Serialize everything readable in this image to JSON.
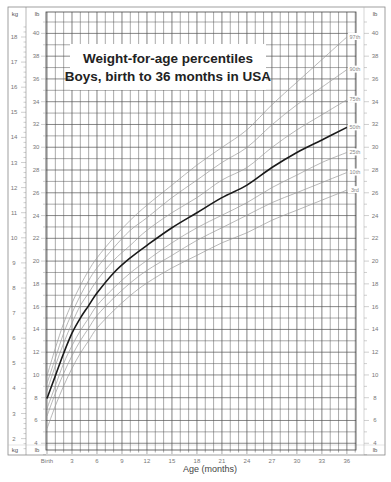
{
  "chart_data": {
    "type": "line",
    "title": "Weight-for-age percentiles",
    "subtitle": "Boys, birth to 36 months in USA",
    "xlabel": "Age (months)",
    "ylabel_left": "kg",
    "ylabel_right": "lb",
    "xlim": [
      0,
      36
    ],
    "ylim_kg": [
      1.5,
      18.5
    ],
    "x_ticks": [
      {
        "value": 0,
        "label": "Birth"
      },
      {
        "value": 3,
        "label": "3"
      },
      {
        "value": 6,
        "label": "6"
      },
      {
        "value": 9,
        "label": "9"
      },
      {
        "value": 12,
        "label": "12"
      },
      {
        "value": 15,
        "label": "15"
      },
      {
        "value": 18,
        "label": "18"
      },
      {
        "value": 21,
        "label": "21"
      },
      {
        "value": 24,
        "label": "24"
      },
      {
        "value": 27,
        "label": "27"
      },
      {
        "value": 30,
        "label": "30"
      },
      {
        "value": 33,
        "label": "33"
      },
      {
        "value": 36,
        "label": "36"
      }
    ],
    "kg_ticks": [
      2,
      3,
      4,
      5,
      6,
      7,
      8,
      9,
      10,
      11,
      12,
      13,
      14,
      15,
      16,
      17,
      18
    ],
    "lb_ticks": [
      4,
      6,
      8,
      10,
      12,
      14,
      16,
      18,
      20,
      22,
      24,
      26,
      28,
      30,
      32,
      34,
      36,
      38,
      40
    ],
    "grid": true,
    "x": [
      0,
      1,
      2,
      3,
      4,
      5,
      6,
      8,
      10,
      12,
      15,
      18,
      21,
      24,
      27,
      30,
      33,
      36
    ],
    "series": [
      {
        "name": "97th",
        "label": "97th",
        "emphasis": false,
        "values": [
          4.5,
          5.6,
          6.6,
          7.4,
          8.1,
          8.7,
          9.2,
          10.0,
          10.7,
          11.3,
          12.1,
          12.9,
          13.6,
          14.3,
          15.3,
          16.2,
          17.1,
          18.0
        ]
      },
      {
        "name": "90th",
        "label": "90th",
        "emphasis": false,
        "values": [
          4.2,
          5.2,
          6.2,
          7.0,
          7.7,
          8.3,
          8.8,
          9.6,
          10.3,
          10.8,
          11.6,
          12.3,
          13.0,
          13.6,
          14.5,
          15.3,
          16.0,
          16.7
        ]
      },
      {
        "name": "75th",
        "label": "75th",
        "emphasis": false,
        "values": [
          3.9,
          4.9,
          5.8,
          6.6,
          7.3,
          7.8,
          8.3,
          9.1,
          9.7,
          10.3,
          11.0,
          11.6,
          12.3,
          12.8,
          13.6,
          14.3,
          14.9,
          15.5
        ]
      },
      {
        "name": "50th",
        "label": "50th",
        "emphasis": true,
        "values": [
          3.6,
          4.5,
          5.4,
          6.2,
          6.8,
          7.3,
          7.8,
          8.6,
          9.2,
          9.7,
          10.4,
          11.0,
          11.6,
          12.1,
          12.8,
          13.4,
          13.9,
          14.4
        ]
      },
      {
        "name": "25th",
        "label": "25th",
        "emphasis": false,
        "values": [
          3.2,
          4.1,
          5.0,
          5.7,
          6.3,
          6.8,
          7.3,
          8.0,
          8.6,
          9.1,
          9.8,
          10.4,
          10.9,
          11.4,
          12.0,
          12.5,
          13.0,
          13.4
        ]
      },
      {
        "name": "10th",
        "label": "10th",
        "emphasis": false,
        "values": [
          2.9,
          3.8,
          4.6,
          5.3,
          5.9,
          6.4,
          6.9,
          7.6,
          8.2,
          8.7,
          9.3,
          9.9,
          10.4,
          10.9,
          11.4,
          11.8,
          12.2,
          12.6
        ]
      },
      {
        "name": "3rd",
        "label": "3rd",
        "emphasis": false,
        "values": [
          2.4,
          3.3,
          4.1,
          4.8,
          5.4,
          5.9,
          6.4,
          7.1,
          7.7,
          8.2,
          8.8,
          9.3,
          9.8,
          10.2,
          10.7,
          11.1,
          11.5,
          11.9
        ]
      }
    ]
  },
  "colors": {
    "grid": "#555555",
    "curve_light": "#9a9a9a",
    "curve_bold": "#1a1a1a",
    "text": "#777777"
  }
}
